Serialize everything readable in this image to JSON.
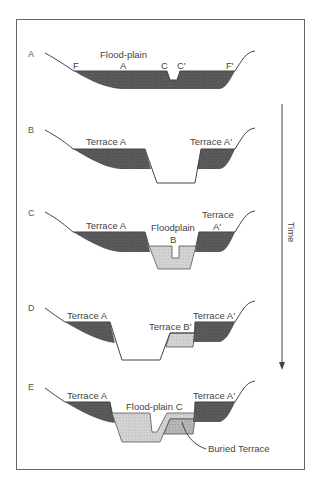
{
  "figure": {
    "colors": {
      "frame": "#666666",
      "profile_line": "#444444",
      "older_alluvium_fill": "#595959",
      "younger_alluvium_fill": "#d2d2d2",
      "buried_terrace_fill": "#b4b4b4",
      "text": "#444444"
    },
    "time_axis": {
      "label": "Time",
      "direction": "down"
    },
    "stages": [
      {
        "id": "A",
        "labels": [
          "Flood-plain",
          "F",
          "A",
          "C",
          "C'",
          "F'"
        ]
      },
      {
        "id": "B",
        "labels": [
          "Terrace A",
          "Terrace A'"
        ]
      },
      {
        "id": "C",
        "labels": [
          "Terrace A",
          "Floodplain",
          "B",
          "Terrace",
          "A'"
        ]
      },
      {
        "id": "D",
        "labels": [
          "Terrace A",
          "Terrace B'",
          "Terrace A'"
        ]
      },
      {
        "id": "E",
        "labels": [
          "Terrace A",
          "Flood-plain C",
          "Terrace A'",
          "Buried Terrace"
        ]
      }
    ]
  }
}
